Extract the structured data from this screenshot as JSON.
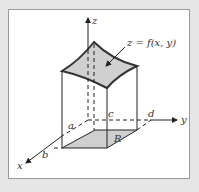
{
  "figure": {
    "surface_label": "z = f(x, y)",
    "region_label": "R",
    "axes": {
      "x": "x",
      "y": "y",
      "z": "z"
    },
    "bounds": {
      "a": "a",
      "b": "b",
      "c": "c",
      "d": "d"
    }
  },
  "colors": {
    "surface_fill": "#d0d0d0",
    "region_fill": "#cfcfcf",
    "line": "#222222",
    "background": "#e6e6e6"
  }
}
